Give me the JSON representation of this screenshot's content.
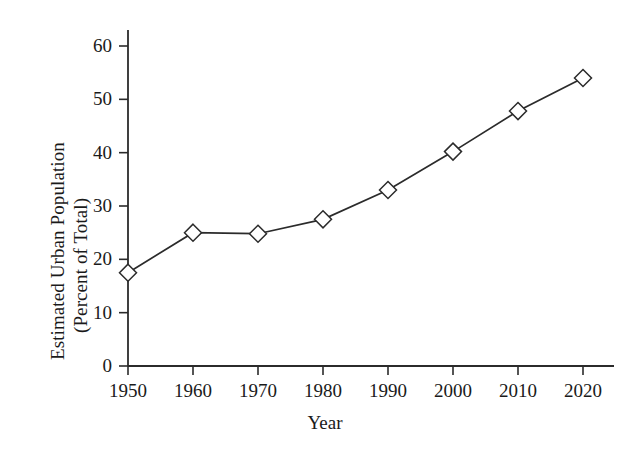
{
  "chart_data": {
    "type": "line",
    "title": "",
    "xlabel": "Year",
    "ylabel": "Estimated Urban Population (Percent of Total)",
    "ylabel_lines": [
      "Estimated Urban Population",
      "(Percent of Total)"
    ],
    "categories": [
      "1950",
      "1960",
      "1970",
      "1980",
      "1990",
      "2000",
      "2010",
      "2020"
    ],
    "x": [
      1950,
      1960,
      1970,
      1980,
      1990,
      2000,
      2010,
      2020
    ],
    "values": [
      17.5,
      25,
      24.8,
      27.5,
      33,
      40.2,
      47.8,
      54
    ],
    "xlim": [
      1950,
      2020
    ],
    "ylim": [
      0,
      63
    ],
    "xticks": [
      1950,
      1960,
      1970,
      1980,
      1990,
      2000,
      2010,
      2020
    ],
    "xtick_labels": [
      "1950",
      "1960",
      "1970",
      "1980",
      "1990",
      "2000",
      "2010",
      "2020"
    ],
    "yticks": [
      0,
      10,
      20,
      30,
      40,
      50,
      60
    ],
    "ytick_labels": [
      "0",
      "10",
      "20",
      "30",
      "40",
      "50",
      "60"
    ],
    "grid": false,
    "legend": null,
    "marker": "diamond",
    "line_color": "#2b2b2b",
    "marker_face_color": "#ffffff",
    "background_color": "#ffffff"
  }
}
